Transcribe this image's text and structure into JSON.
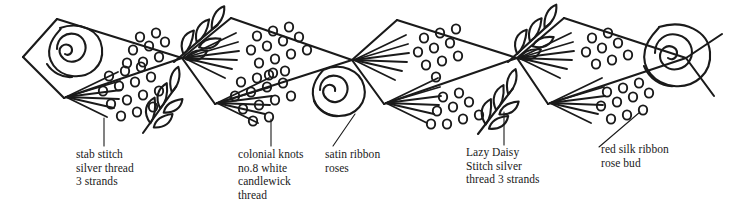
{
  "figure": {
    "ink_color": "#1a1a1a",
    "background_color": "#ffffff",
    "width": 736,
    "height": 215
  },
  "labels": [
    {
      "id": "stab",
      "text": "stab stitch\nsilver thread\n3 strands",
      "lines": [
        "stab stitch",
        "silver thread",
        "3 strands"
      ]
    },
    {
      "id": "colonial",
      "text": "colonial knots\nno.8 white\ncandlewick\nthread",
      "lines": [
        "colonial knots",
        "no.8 white",
        "candlewick",
        "thread"
      ]
    },
    {
      "id": "satin",
      "text": "satin ribbon\nroses",
      "lines": [
        "satin ribbon",
        "roses"
      ]
    },
    {
      "id": "lazy",
      "text": "Lazy Daisy\nStitch silver\nthread 3 strands",
      "lines": [
        "Lazy Daisy",
        "Stitch silver",
        "thread 3 strands"
      ]
    },
    {
      "id": "redsilk",
      "text": "red silk ribbon\nrose bud",
      "lines": [
        "red silk ribbon",
        "rose bud"
      ]
    }
  ],
  "motifs": {
    "roses": 3,
    "knot_fields": 6,
    "stab_fans": 6,
    "leaf_sprigs": 4
  }
}
